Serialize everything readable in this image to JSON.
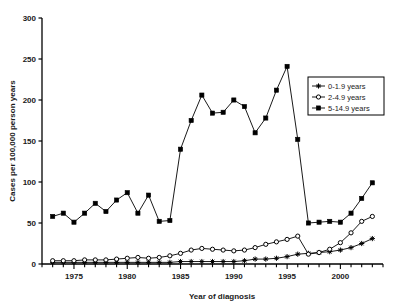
{
  "chart_data": {
    "type": "line",
    "title": "",
    "xlabel": "Year of diagnosis",
    "ylabel": "Cases per 100,000 person years",
    "xlim": [
      1972,
      2004
    ],
    "ylim": [
      0,
      300
    ],
    "yticks": [
      0,
      50,
      100,
      150,
      200,
      250,
      300
    ],
    "xticks": [
      1975,
      1980,
      1985,
      1990,
      1995,
      2000
    ],
    "x_minor_tick_interval": 1,
    "grid": false,
    "legend_position": "upper-right",
    "x": [
      1973,
      1974,
      1975,
      1976,
      1977,
      1978,
      1979,
      1980,
      1981,
      1982,
      1983,
      1984,
      1985,
      1986,
      1987,
      1988,
      1989,
      1990,
      1991,
      1992,
      1993,
      1994,
      1995,
      1996,
      1997,
      1998,
      1999,
      2000,
      2001,
      2002,
      2003
    ],
    "series": [
      {
        "name": "0-1.9 years",
        "marker": "star",
        "values": [
          2,
          2,
          2,
          2,
          2,
          2,
          2,
          2,
          2,
          2,
          2,
          2,
          3,
          3,
          3,
          3,
          3,
          3,
          4,
          6,
          6,
          7,
          9,
          12,
          13,
          14,
          15,
          17,
          20,
          25,
          31
        ]
      },
      {
        "name": "2-4.9 years",
        "marker": "open-circle",
        "values": [
          4,
          4,
          4,
          5,
          5,
          5,
          6,
          7,
          8,
          7,
          8,
          10,
          13,
          17,
          19,
          18,
          17,
          16,
          17,
          20,
          24,
          27,
          30,
          34,
          12,
          14,
          18,
          26,
          38,
          52,
          58
        ]
      },
      {
        "name": "5-14.9 years",
        "marker": "filled-square",
        "values": [
          58,
          62,
          51,
          62,
          74,
          64,
          78,
          87,
          62,
          84,
          52,
          53,
          140,
          175,
          206,
          184,
          185,
          200,
          192,
          160,
          178,
          212,
          241,
          152,
          50,
          51,
          52,
          51,
          62,
          80,
          99
        ]
      }
    ]
  },
  "legend": {
    "entries": [
      {
        "label": "0-1.9 years",
        "marker": "star"
      },
      {
        "label": "2-4.9 years",
        "marker": "open-circle"
      },
      {
        "label": "5-14.9 years",
        "marker": "filled-square"
      }
    ]
  },
  "colors": {
    "line": "#000000",
    "axis": "#000000",
    "background": "#ffffff",
    "marker_fill": "#000000",
    "marker_open_fill": "#ffffff"
  }
}
